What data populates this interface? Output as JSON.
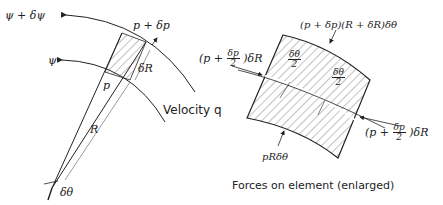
{
  "left_figure": {
    "streamline_outer": "ψ + δψ",
    "streamline_inner": "ψ",
    "pressure_outer": "p + δp",
    "pressure_inner": "p",
    "radial_increment": "δR",
    "radius": "R",
    "angle": "δθ",
    "velocity_label": "Velocity q"
  },
  "right_figure": {
    "top_force": "(p + δp)(R + δR)δθ",
    "left_force_prefix": "(p +",
    "left_force_num": "δp",
    "left_force_den": "2",
    "left_force_suffix": ")δR",
    "half_angle_num": "δθ",
    "half_angle_den": "2",
    "right_force_prefix": "(p +",
    "right_force_num": "δp",
    "right_force_den": "2",
    "right_force_suffix": ")δR",
    "bottom_force": "pRδθ",
    "caption": "Forces on element (enlarged)"
  },
  "colors": {
    "ink": "#222222",
    "background": "#ffffff"
  }
}
